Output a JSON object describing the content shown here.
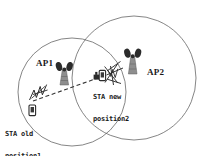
{
  "diagram": {
    "type": "network-coverage-diagram",
    "background_color": "#ffffff",
    "stroke_color": "#555555",
    "text_color": "#1a1a1a",
    "tower_body_color": "#8a8a8a",
    "tower_antenna_color": "#2b2b2b",
    "coverage_areas": [
      {
        "name": "ap1-coverage-circle",
        "label": "AP1",
        "cx": 72,
        "cy": 92,
        "r": 54
      },
      {
        "name": "ap2-coverage-circle",
        "label": "AP2",
        "cx": 134,
        "cy": 78,
        "r": 62
      }
    ],
    "access_points": [
      {
        "id": "ap1",
        "label": "AP1",
        "x": 63,
        "y": 75
      },
      {
        "id": "ap2",
        "label": "AP2",
        "x": 132,
        "y": 62
      }
    ],
    "stations": [
      {
        "id": "sta-old",
        "label_line1": "STA old",
        "label_line2": "position1",
        "x": 41,
        "y": 108
      },
      {
        "id": "sta-new",
        "label_line1": "STA new",
        "label_line2": "position2",
        "x": 102,
        "y": 75
      }
    ],
    "movement_path": {
      "name": "sta-movement-dashed-line",
      "from_x": 33,
      "from_y": 101,
      "to_x": 98,
      "to_y": 78,
      "style": "dashed"
    }
  }
}
